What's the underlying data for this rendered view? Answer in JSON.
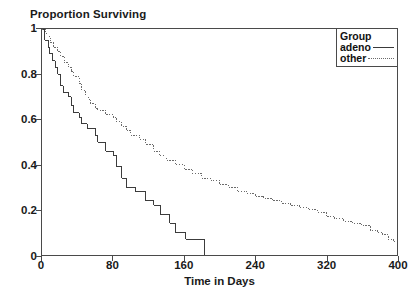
{
  "chart_data": {
    "type": "line",
    "title": "",
    "ylabel": "Proportion Surviving",
    "xlabel": "Time in Days",
    "xlim": [
      0,
      400
    ],
    "ylim": [
      0,
      1
    ],
    "xticks": [
      0,
      80,
      160,
      240,
      320,
      400
    ],
    "xtick_labels": [
      "0",
      "80",
      "160",
      "240",
      "320",
      "400"
    ],
    "yticks": [
      0,
      0.2,
      0.4,
      0.6,
      0.8,
      1
    ],
    "ytick_labels": [
      "0",
      "0.2",
      "0.4",
      "0.6",
      "0.8",
      "1"
    ],
    "grid": false,
    "legend_position": "top-right",
    "legend": {
      "title": "Group",
      "entries": [
        {
          "label": "adeno",
          "style": "solid",
          "color": "#3a3a3a"
        },
        {
          "label": "other",
          "style": "dotted",
          "color": "#6a6a6a"
        }
      ]
    },
    "series": [
      {
        "name": "adeno",
        "style": "solid",
        "color": "#3a3a3a",
        "step": "post",
        "points": [
          [
            0,
            1.0
          ],
          [
            3,
            0.95
          ],
          [
            7,
            0.92
          ],
          [
            8,
            0.89
          ],
          [
            12,
            0.86
          ],
          [
            15,
            0.83
          ],
          [
            18,
            0.8
          ],
          [
            21,
            0.75
          ],
          [
            24,
            0.72
          ],
          [
            30,
            0.7
          ],
          [
            33,
            0.66
          ],
          [
            36,
            0.63
          ],
          [
            42,
            0.61
          ],
          [
            45,
            0.58
          ],
          [
            51,
            0.56
          ],
          [
            60,
            0.53
          ],
          [
            63,
            0.5
          ],
          [
            72,
            0.46
          ],
          [
            80,
            0.44
          ],
          [
            84,
            0.39
          ],
          [
            90,
            0.34
          ],
          [
            95,
            0.3
          ],
          [
            105,
            0.28
          ],
          [
            117,
            0.24
          ],
          [
            126,
            0.22
          ],
          [
            133,
            0.18
          ],
          [
            144,
            0.14
          ],
          [
            150,
            0.1
          ],
          [
            162,
            0.07
          ],
          [
            183,
            0.0
          ],
          [
            200,
            0.0
          ]
        ]
      },
      {
        "name": "other",
        "style": "dotted",
        "color": "#6a6a6a",
        "step": "post",
        "points": [
          [
            0,
            1.0
          ],
          [
            4,
            0.98
          ],
          [
            8,
            0.96
          ],
          [
            10,
            0.94
          ],
          [
            13,
            0.92
          ],
          [
            18,
            0.9
          ],
          [
            21,
            0.88
          ],
          [
            25,
            0.85
          ],
          [
            30,
            0.83
          ],
          [
            33,
            0.81
          ],
          [
            36,
            0.79
          ],
          [
            42,
            0.76
          ],
          [
            45,
            0.73
          ],
          [
            49,
            0.71
          ],
          [
            52,
            0.69
          ],
          [
            55,
            0.67
          ],
          [
            60,
            0.65
          ],
          [
            63,
            0.64
          ],
          [
            72,
            0.62
          ],
          [
            80,
            0.61
          ],
          [
            84,
            0.59
          ],
          [
            90,
            0.57
          ],
          [
            95,
            0.55
          ],
          [
            100,
            0.53
          ],
          [
            110,
            0.51
          ],
          [
            117,
            0.49
          ],
          [
            126,
            0.46
          ],
          [
            132,
            0.44
          ],
          [
            140,
            0.42
          ],
          [
            150,
            0.4
          ],
          [
            160,
            0.38
          ],
          [
            170,
            0.36
          ],
          [
            180,
            0.34
          ],
          [
            190,
            0.33
          ],
          [
            200,
            0.31
          ],
          [
            210,
            0.3
          ],
          [
            220,
            0.28
          ],
          [
            231,
            0.27
          ],
          [
            240,
            0.26
          ],
          [
            250,
            0.25
          ],
          [
            260,
            0.24
          ],
          [
            270,
            0.23
          ],
          [
            280,
            0.22
          ],
          [
            290,
            0.21
          ],
          [
            300,
            0.2
          ],
          [
            310,
            0.19
          ],
          [
            320,
            0.17
          ],
          [
            330,
            0.16
          ],
          [
            340,
            0.15
          ],
          [
            350,
            0.14
          ],
          [
            360,
            0.13
          ],
          [
            370,
            0.11
          ],
          [
            378,
            0.1
          ],
          [
            384,
            0.09
          ],
          [
            390,
            0.07
          ],
          [
            396,
            0.06
          ],
          [
            400,
            0.06
          ]
        ]
      }
    ]
  }
}
